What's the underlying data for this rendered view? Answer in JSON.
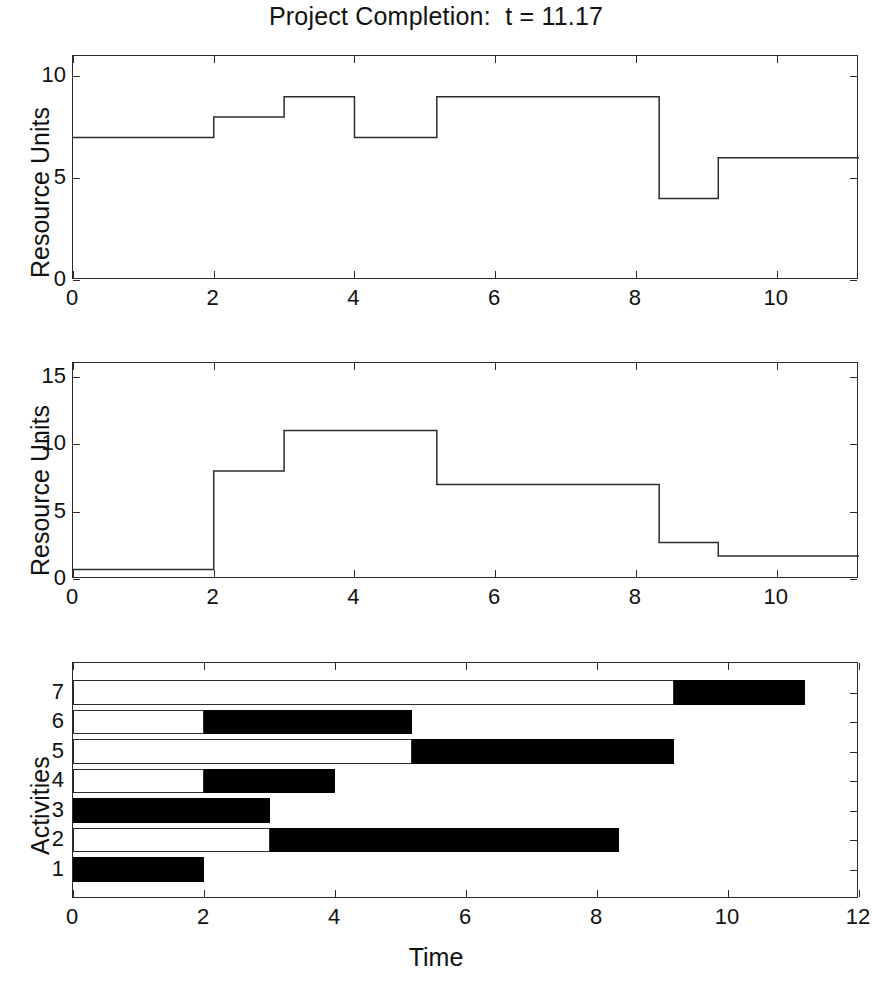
{
  "figure": {
    "title": "Project Completion:  t = 11.17",
    "width": 872,
    "height": 983,
    "background": "#ffffff",
    "line_color": "#2b2b2b",
    "fill_color": "#000000"
  },
  "chart_data": [
    {
      "id": "resource-profile-1",
      "type": "line",
      "subtype": "step",
      "title": "Project Completion:  t = 11.17",
      "xlabel": "",
      "ylabel": "Resource Units",
      "xlim": [
        0,
        11.17
      ],
      "ylim": [
        0,
        11.0
      ],
      "xticks": [
        0,
        2,
        4,
        6,
        8,
        10
      ],
      "xticklabels": [
        "0",
        "2",
        "4",
        "6",
        "8",
        "10"
      ],
      "yticks": [
        0,
        5,
        10
      ],
      "yticklabels": [
        "0",
        "5",
        "10"
      ],
      "grid": false,
      "legend": null,
      "steps": [
        {
          "x_start": 0.0,
          "x_end": 2.0,
          "y": 7
        },
        {
          "x_start": 2.0,
          "x_end": 3.0,
          "y": 8
        },
        {
          "x_start": 3.0,
          "x_end": 4.0,
          "y": 9
        },
        {
          "x_start": 4.0,
          "x_end": 5.17,
          "y": 7
        },
        {
          "x_start": 5.17,
          "x_end": 8.33,
          "y": 9
        },
        {
          "x_start": 8.33,
          "x_end": 9.17,
          "y": 4
        },
        {
          "x_start": 9.17,
          "x_end": 11.17,
          "y": 6
        }
      ]
    },
    {
      "id": "resource-profile-2",
      "type": "line",
      "subtype": "step",
      "title": "",
      "xlabel": "",
      "ylabel": "Resource Units",
      "xlim": [
        0,
        11.17
      ],
      "ylim": [
        0,
        16.0
      ],
      "xticks": [
        0,
        2,
        4,
        6,
        8,
        10
      ],
      "xticklabels": [
        "0",
        "2",
        "4",
        "6",
        "8",
        "10"
      ],
      "yticks": [
        0,
        5,
        10,
        15
      ],
      "yticklabels": [
        "0",
        "5",
        "10",
        "15"
      ],
      "grid": false,
      "legend": null,
      "steps": [
        {
          "x_start": 0.0,
          "x_end": 2.0,
          "y": 0.7
        },
        {
          "x_start": 2.0,
          "x_end": 3.0,
          "y": 8
        },
        {
          "x_start": 3.0,
          "x_end": 5.17,
          "y": 11
        },
        {
          "x_start": 5.17,
          "x_end": 8.33,
          "y": 7
        },
        {
          "x_start": 8.33,
          "x_end": 9.17,
          "y": 2.7
        },
        {
          "x_start": 9.17,
          "x_end": 11.17,
          "y": 1.7
        }
      ]
    },
    {
      "id": "activity-gantt",
      "type": "bar",
      "subtype": "gantt",
      "orientation": "horizontal",
      "title": "",
      "xlabel": "Time",
      "ylabel": "Activities",
      "xlim": [
        0,
        12
      ],
      "ylim": [
        0,
        8
      ],
      "xticks": [
        0,
        2,
        4,
        6,
        8,
        10,
        12
      ],
      "xticklabels": [
        "0",
        "2",
        "4",
        "6",
        "8",
        "10",
        "12"
      ],
      "yticks": [
        1,
        2,
        3,
        4,
        5,
        6,
        7
      ],
      "yticklabels": [
        "1",
        "2",
        "3",
        "4",
        "5",
        "6",
        "7"
      ],
      "grid": false,
      "legend": null,
      "bar_kinds": {
        "slack": "white float bar",
        "work": "black duration bar"
      },
      "activities": [
        {
          "label": "1",
          "slack_start": 0.0,
          "slack_end": 0.0,
          "work_start": 0.0,
          "work_end": 2.0
        },
        {
          "label": "2",
          "slack_start": 0.0,
          "slack_end": 3.0,
          "work_start": 3.0,
          "work_end": 8.33
        },
        {
          "label": "3",
          "slack_start": 0.0,
          "slack_end": 0.0,
          "work_start": 0.0,
          "work_end": 3.0
        },
        {
          "label": "4",
          "slack_start": 0.0,
          "slack_end": 2.0,
          "work_start": 2.0,
          "work_end": 4.0
        },
        {
          "label": "5",
          "slack_start": 0.0,
          "slack_end": 5.17,
          "work_start": 5.17,
          "work_end": 9.17
        },
        {
          "label": "6",
          "slack_start": 0.0,
          "slack_end": 2.0,
          "work_start": 2.0,
          "work_end": 5.17
        },
        {
          "label": "7",
          "slack_start": 0.0,
          "slack_end": 9.17,
          "work_start": 9.17,
          "work_end": 11.17
        }
      ]
    }
  ]
}
